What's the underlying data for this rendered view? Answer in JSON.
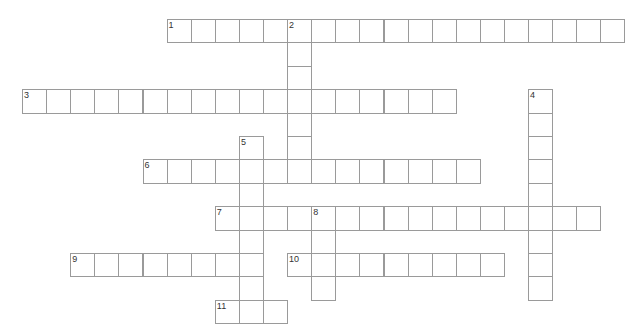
{
  "puzzle": {
    "grid": {
      "origin_x": 22,
      "origin_y": 19,
      "cell_w": 24.1,
      "cell_h": 23.4,
      "border_color": "#9a9a9a"
    },
    "entries": [
      {
        "number": "1",
        "direction": "across",
        "row": 0,
        "col": 6,
        "length": 19
      },
      {
        "number": "2",
        "direction": "down",
        "row": 0,
        "col": 11,
        "length": 7
      },
      {
        "number": "3",
        "direction": "across",
        "row": 3,
        "col": 0,
        "length": 18
      },
      {
        "number": "4",
        "direction": "down",
        "row": 3,
        "col": 21,
        "length": 9
      },
      {
        "number": "5",
        "direction": "down",
        "row": 5,
        "col": 9,
        "length": 8
      },
      {
        "number": "6",
        "direction": "across",
        "row": 6,
        "col": 5,
        "length": 14
      },
      {
        "number": "7",
        "direction": "across",
        "row": 8,
        "col": 8,
        "length": 16
      },
      {
        "number": "8",
        "direction": "down",
        "row": 8,
        "col": 12,
        "length": 4
      },
      {
        "number": "9",
        "direction": "across",
        "row": 10,
        "col": 2,
        "length": 8
      },
      {
        "number": "10",
        "direction": "across",
        "row": 10,
        "col": 11,
        "length": 9
      },
      {
        "number": "11",
        "direction": "across",
        "row": 12,
        "col": 8,
        "length": 3
      }
    ]
  }
}
